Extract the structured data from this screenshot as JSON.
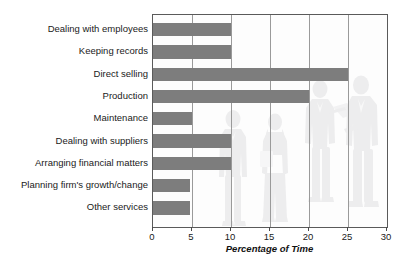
{
  "chart_data": {
    "type": "bar",
    "orientation": "horizontal",
    "title": "",
    "xlabel": "Percentage of Time",
    "ylabel": "",
    "xlim": [
      0,
      30
    ],
    "xticks": [
      0,
      5,
      10,
      15,
      20,
      25,
      30
    ],
    "xtick_labels": [
      "0",
      "5",
      "10",
      "15",
      "20",
      "25",
      "30"
    ],
    "grid": true,
    "grid_axis": "x",
    "legend": false,
    "categories": [
      "Dealing with employees",
      "Keeping records",
      "Direct selling",
      "Production",
      "Maintenance",
      "Dealing with suppliers",
      "Arranging financial matters",
      "Planning firm's growth/change",
      "Other services"
    ],
    "values": [
      10,
      10,
      25,
      20,
      5,
      10,
      10,
      4.8,
      4.8
    ],
    "bar_color": "#7d7d7d",
    "axis_color": "#5a5a5a",
    "gridline_color": "#9a9a9a",
    "background_color": "#ffffff"
  },
  "watermark": {
    "name": "business-people-silhouettes",
    "color": "#eceded",
    "description": "Faint silhouettes of business people behind the plot"
  }
}
